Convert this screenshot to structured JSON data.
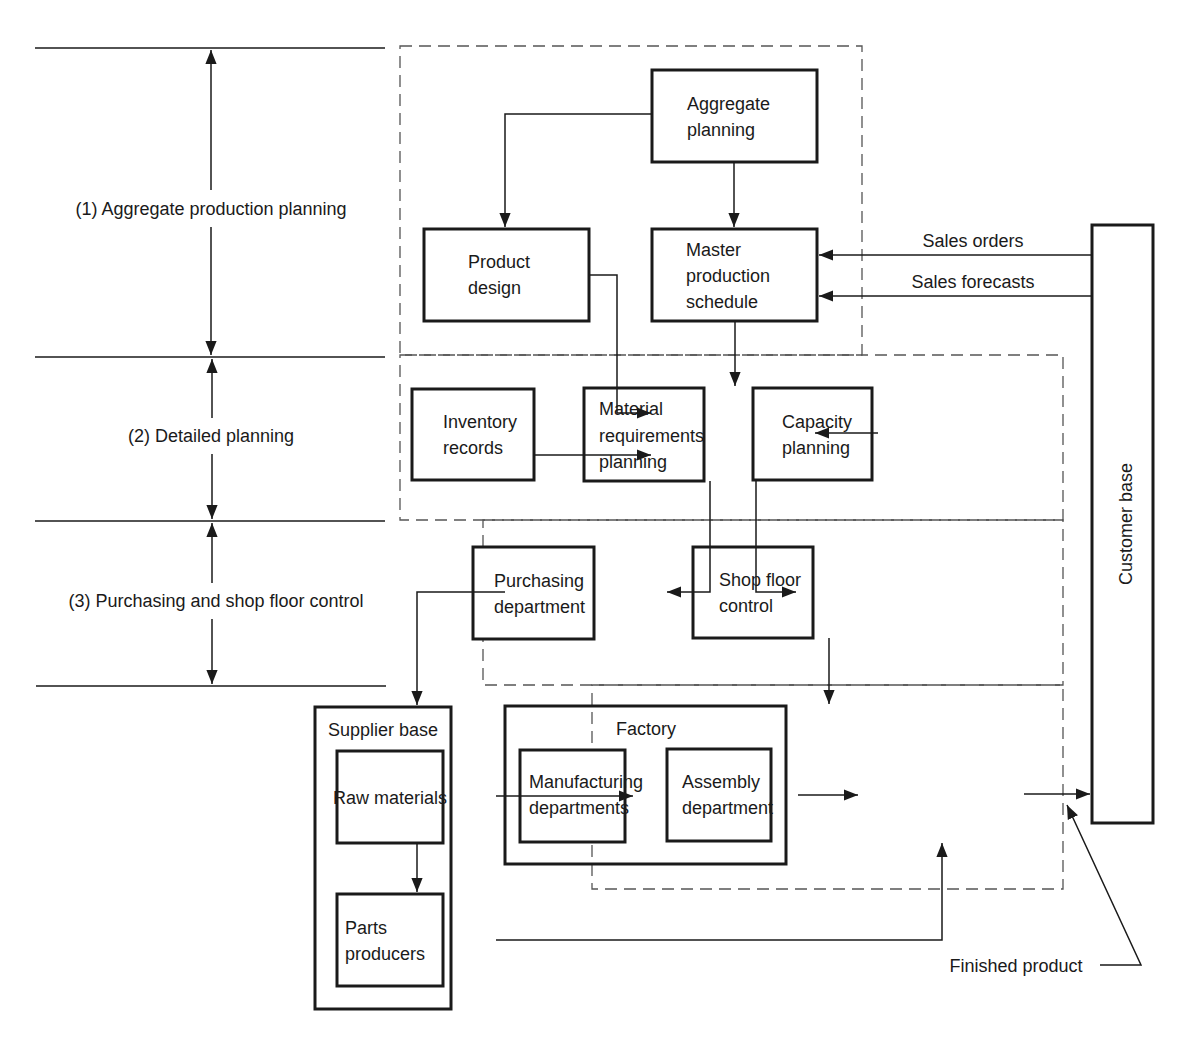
{
  "levels": [
    {
      "label": "(1) Aggregate production planning"
    },
    {
      "label": "(2) Detailed planning"
    },
    {
      "label": "(3) Purchasing and shop floor control"
    }
  ],
  "nodes": {
    "aggregate_planning": {
      "lines": [
        "Aggregate",
        "planning"
      ]
    },
    "product_design": {
      "lines": [
        "Product",
        "design"
      ]
    },
    "master_production_schedule": {
      "lines": [
        "Master",
        "production",
        "schedule"
      ]
    },
    "inventory_records": {
      "lines": [
        "Inventory",
        "records"
      ]
    },
    "material_requirements_planning": {
      "lines": [
        "Material",
        "requirements",
        "planning"
      ]
    },
    "capacity_planning": {
      "lines": [
        "Capacity",
        "planning"
      ]
    },
    "purchasing_department": {
      "lines": [
        "Purchasing",
        "department"
      ]
    },
    "shop_floor_control": {
      "lines": [
        "Shop floor",
        "control"
      ]
    },
    "supplier_base": {
      "title": "Supplier base"
    },
    "raw_materials": {
      "lines": [
        "Raw materials"
      ]
    },
    "parts_producers": {
      "lines": [
        "Parts",
        "producers"
      ]
    },
    "factory": {
      "title": "Factory"
    },
    "manufacturing_departments": {
      "lines": [
        "Manufacturing",
        "departments"
      ]
    },
    "assembly_department": {
      "lines": [
        "Assembly",
        "department"
      ]
    },
    "customer_base": {
      "title": "Customer base"
    }
  },
  "flows": {
    "sales_orders": "Sales orders",
    "sales_forecasts": "Sales forecasts",
    "finished_product": "Finished product"
  }
}
